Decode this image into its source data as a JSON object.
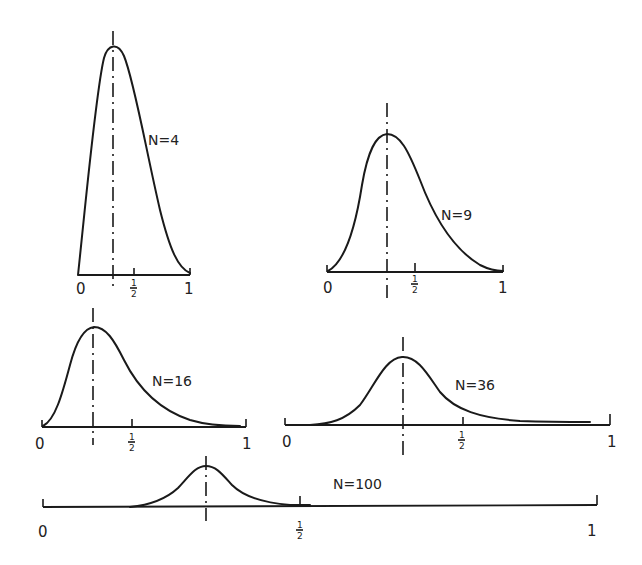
{
  "figure": {
    "panels": [
      {
        "label": "N=4",
        "axis_start": "0",
        "axis_half": "½",
        "axis_end": "1"
      },
      {
        "label": "N=9",
        "axis_start": "0",
        "axis_half": "½",
        "axis_end": "1"
      },
      {
        "label": "N=16",
        "axis_start": "0",
        "axis_half": "½",
        "axis_end": "1"
      },
      {
        "label": "N=36",
        "axis_start": "0",
        "axis_half": "½",
        "axis_end": "1"
      },
      {
        "label": "N=100",
        "axis_start": "0",
        "axis_half": "½",
        "axis_end": "1"
      }
    ],
    "frac_num": "1",
    "frac_den": "2"
  },
  "colors": {
    "ink": "#1a1a1a",
    "background": "#ffffff"
  }
}
